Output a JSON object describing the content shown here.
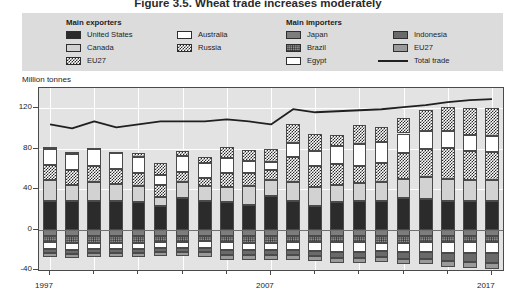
{
  "title": {
    "number": "Figure 3.5.",
    "text": "Wheat trade increases moderately"
  },
  "legend": {
    "exporters_heading": "Main exporters",
    "importers_heading": "Main importers",
    "exporters": [
      {
        "label": "United States",
        "fill": "solid-black",
        "color": "#2b2b2b"
      },
      {
        "label": "Canada",
        "fill": "solid-light-gray",
        "color": "#d2d2d2"
      },
      {
        "label": "EU27",
        "fill": "checkerboard",
        "color": "#2b2b2b"
      },
      {
        "label": "Australia",
        "fill": "white",
        "color": "#ffffff"
      },
      {
        "label": "Russia",
        "fill": "checkerboard",
        "color": "#2b2b2b"
      }
    ],
    "importers": [
      {
        "label": "Japan",
        "fill": "solid-gray",
        "color": "#7d7d7d"
      },
      {
        "label": "Brazil",
        "fill": "dotted",
        "color": "#8e8e8e"
      },
      {
        "label": "Egypt",
        "fill": "white",
        "color": "#ffffff"
      },
      {
        "label": "Indonesia",
        "fill": "solid-dark-gray",
        "color": "#6a6a6a"
      },
      {
        "label": "EU27",
        "fill": "solid-mid-gray",
        "color": "#9a9a9a"
      }
    ],
    "total_trade_label": "Total trade",
    "total_trade_color": "#202020"
  },
  "chart_data": {
    "type": "bar",
    "subtype": "stacked-bar-with-line",
    "title": "Wheat trade increases moderately",
    "xlabel": "",
    "ylabel": "Million tonnes",
    "ylim": [
      -40,
      140
    ],
    "yticks": [
      -40,
      0,
      40,
      80,
      120
    ],
    "ytick_labels": [
      "-40",
      "0",
      "40",
      "80",
      "120"
    ],
    "grid": true,
    "legend_position": "top",
    "x": [
      1997,
      1998,
      1999,
      2000,
      2001,
      2002,
      2003,
      2004,
      2005,
      2006,
      2007,
      2008,
      2009,
      2010,
      2011,
      2012,
      2013,
      2014,
      2015,
      2016,
      2017
    ],
    "xtick_labels": [
      "1997",
      "2007",
      "2017"
    ],
    "xtick_values": [
      1997,
      2007,
      2017
    ],
    "exporter_series": [
      {
        "name": "United States",
        "values": [
          28,
          28,
          28,
          28,
          27,
          23,
          31,
          28,
          27,
          24,
          33,
          28,
          23,
          27,
          28,
          28,
          31,
          30,
          28,
          28,
          28
        ]
      },
      {
        "name": "Canada",
        "values": [
          21,
          16,
          19,
          17,
          16,
          9,
          16,
          15,
          15,
          19,
          16,
          19,
          19,
          17,
          18,
          19,
          19,
          22,
          22,
          21,
          21
        ]
      },
      {
        "name": "EU27",
        "values": [
          15,
          15,
          16,
          15,
          13,
          12,
          10,
          8,
          14,
          13,
          10,
          25,
          21,
          21,
          17,
          19,
          26,
          28,
          31,
          29,
          28
        ]
      },
      {
        "name": "Australia",
        "values": [
          16,
          16,
          17,
          16,
          16,
          10,
          16,
          15,
          15,
          12,
          8,
          14,
          15,
          18,
          22,
          21,
          19,
          17,
          16,
          16,
          16
        ]
      },
      {
        "name": "Russia",
        "values": [
          2,
          2,
          1,
          1,
          4,
          12,
          5,
          6,
          11,
          11,
          13,
          18,
          17,
          11,
          18,
          14,
          15,
          21,
          24,
          26,
          27
        ]
      }
    ],
    "importer_series": [
      {
        "name": "Japan",
        "values": [
          -6,
          -6,
          -6,
          -6,
          -6,
          -6,
          -6,
          -6,
          -6,
          -6,
          -6,
          -6,
          -6,
          -6,
          -6,
          -6,
          -6,
          -6,
          -6,
          -6,
          -6
        ]
      },
      {
        "name": "Brazil",
        "values": [
          -6,
          -7,
          -7,
          -7,
          -7,
          -6,
          -6,
          -5,
          -6,
          -7,
          -7,
          -6,
          -6,
          -6,
          -6,
          -7,
          -7,
          -6,
          -6,
          -6,
          -6
        ]
      },
      {
        "name": "Egypt",
        "values": [
          -7,
          -7,
          -6,
          -6,
          -6,
          -6,
          -6,
          -7,
          -8,
          -7,
          -7,
          -8,
          -9,
          -10,
          -10,
          -8,
          -9,
          -10,
          -11,
          -11,
          -11
        ]
      },
      {
        "name": "Indonesia",
        "values": [
          -4,
          -4,
          -4,
          -4,
          -4,
          -4,
          -4,
          -4,
          -5,
          -5,
          -5,
          -5,
          -5,
          -6,
          -6,
          -6,
          -7,
          -7,
          -8,
          -9,
          -10
        ]
      },
      {
        "name": "EU27",
        "values": [
          -4,
          -4,
          -4,
          -4,
          -4,
          -4,
          -4,
          -5,
          -5,
          -5,
          -5,
          -5,
          -5,
          -5,
          -5,
          -5,
          -5,
          -5,
          -6,
          -6,
          -6
        ]
      }
    ],
    "total_trade": {
      "name": "Total trade",
      "values": [
        104,
        100,
        107,
        101,
        104,
        107,
        107,
        107,
        109,
        107,
        104,
        119,
        116,
        117,
        118,
        119,
        121,
        123,
        126,
        128,
        129
      ]
    }
  }
}
